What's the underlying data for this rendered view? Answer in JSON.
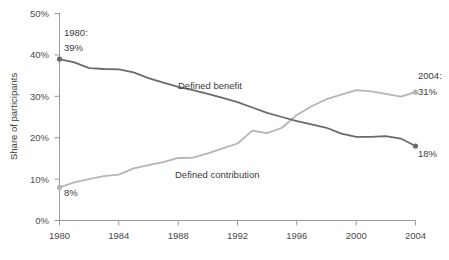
{
  "chart_data": {
    "type": "line",
    "title": "",
    "xlabel": "",
    "ylabel": "Share of participants",
    "xlim": [
      1980,
      2004
    ],
    "ylim": [
      0,
      50
    ],
    "grid": false,
    "legend_position": "inline-labels",
    "x_ticks": [
      "1980",
      "1984",
      "1988",
      "1992",
      "1996",
      "2000",
      "2004"
    ],
    "x_tick_values": [
      1980,
      1984,
      1988,
      1992,
      1996,
      2000,
      2004
    ],
    "y_ticks": [
      "0%",
      "10%",
      "20%",
      "30%",
      "40%",
      "50%"
    ],
    "y_tick_values": [
      0,
      10,
      20,
      30,
      40,
      50
    ],
    "x": [
      1980,
      1981,
      1982,
      1983,
      1984,
      1985,
      1986,
      1987,
      1988,
      1989,
      1990,
      1991,
      1992,
      1993,
      1994,
      1995,
      1996,
      1997,
      1998,
      1999,
      2000,
      2001,
      2002,
      2003,
      2004
    ],
    "series": [
      {
        "name": "Defined benefit",
        "color": "#6b6b6b",
        "values": [
          39,
          38.2,
          36.8,
          36.6,
          36.5,
          35.8,
          34.4,
          33.3,
          32.3,
          31.5,
          30.6,
          29.6,
          28.6,
          27.3,
          26.0,
          25.0,
          24.0,
          23.2,
          22.4,
          21.0,
          20.2,
          20.2,
          20.4,
          19.8,
          18
        ]
      },
      {
        "name": "Defined contribution",
        "color": "#b5b5b5",
        "values": [
          8,
          9.2,
          10.0,
          10.7,
          11.1,
          12.6,
          13.4,
          14.1,
          15.1,
          15.2,
          16.2,
          17.4,
          18.6,
          21.7,
          21.1,
          22.4,
          25.5,
          27.6,
          29.3,
          30.4,
          31.5,
          31.2,
          30.6,
          29.9,
          31
        ]
      }
    ],
    "annotations": [
      {
        "name": "start-defined-benefit",
        "line1": "1980:",
        "line2": "39%",
        "x": 1980,
        "y": 39
      },
      {
        "name": "start-defined-contribution",
        "line1": "",
        "line2": "8%",
        "x": 1980,
        "y": 8
      },
      {
        "name": "end-defined-contribution",
        "line1": "2004:",
        "line2": "31%",
        "x": 2004,
        "y": 31
      },
      {
        "name": "end-defined-benefit",
        "line1": "",
        "line2": "18%",
        "x": 2004,
        "y": 18
      }
    ],
    "series_inline_labels": [
      {
        "name": "Defined benefit",
        "text": "Defined benefit"
      },
      {
        "name": "Defined contribution",
        "text": "Defined contribution"
      }
    ],
    "colors": {
      "defined_benefit": "#6b6b6b",
      "defined_contribution": "#b5b5b5",
      "axis": "#9a9a9a",
      "text": "#3a3a3a",
      "background": "#ffffff"
    }
  },
  "axis": {
    "y_title": "Share of participants"
  },
  "labels": {
    "y_50": "50%",
    "y_40": "40%",
    "y_30": "30%",
    "y_20": "20%",
    "y_10": "10%",
    "y_0": "0%",
    "x_1980": "1980",
    "x_1984": "1984",
    "x_1988": "1988",
    "x_1992": "1992",
    "x_1996": "1996",
    "x_2000": "2000",
    "x_2004": "2004",
    "series_db": "Defined benefit",
    "series_dc": "Defined contribution",
    "annot_1980": "1980:",
    "annot_39": "39%",
    "annot_8": "8%",
    "annot_2004": "2004:",
    "annot_31": "31%",
    "annot_18": "18%"
  }
}
